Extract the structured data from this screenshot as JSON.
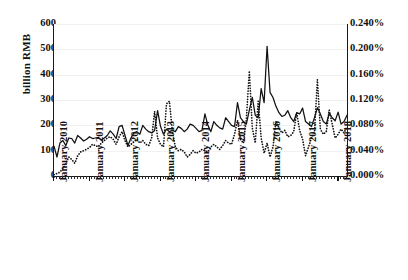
{
  "chart_data": {
    "type": "line",
    "title": "",
    "xlabel": "",
    "ylabel": "billion RMB",
    "y2label": "",
    "ylim": [
      0,
      600
    ],
    "y2lim": [
      0,
      0.24
    ],
    "grid": true,
    "legend": "none",
    "x_tick_labels": [
      "January 2010",
      "January 2011",
      "January 2012",
      "January 2013",
      "January 2014",
      "January 2015",
      "January 2016",
      "January 2017",
      "January 2018"
    ],
    "x_tick_index": [
      0,
      12,
      24,
      36,
      48,
      60,
      72,
      84,
      96
    ],
    "y_tick_labels": [
      "0",
      "100",
      "200",
      "300",
      "400",
      "500",
      "600"
    ],
    "y_tick_values": [
      0,
      100,
      200,
      300,
      400,
      500,
      600
    ],
    "y2_tick_labels": [
      "0.000%",
      "0.040%",
      "0.080%",
      "0.120%",
      "0.160%",
      "0.200%",
      "0.240%"
    ],
    "y2_tick_values": [
      0,
      0.04,
      0.08,
      0.12,
      0.16,
      0.2,
      0.24
    ],
    "n_points": 100,
    "series": [
      {
        "name": "solid-series",
        "style": "solid",
        "axis": "left",
        "units": "billion RMB",
        "values": [
          118,
          75,
          130,
          140,
          120,
          150,
          148,
          130,
          160,
          150,
          138,
          145,
          155,
          148,
          150,
          152,
          142,
          150,
          160,
          178,
          165,
          148,
          195,
          200,
          160,
          120,
          150,
          170,
          175,
          165,
          200,
          185,
          175,
          170,
          180,
          258,
          195,
          165,
          185,
          175,
          180,
          175,
          195,
          188,
          175,
          185,
          205,
          200,
          188,
          175,
          180,
          245,
          200,
          175,
          215,
          200,
          190,
          185,
          230,
          215,
          200,
          195,
          290,
          230,
          215,
          205,
          260,
          310,
          240,
          230,
          345,
          290,
          512,
          330,
          310,
          275,
          250,
          235,
          240,
          258,
          230,
          215,
          250,
          245,
          268,
          215,
          205,
          195,
          230,
          270,
          245,
          215,
          205,
          248,
          230,
          218,
          252,
          205,
          215,
          240
        ]
      },
      {
        "name": "dotted-series",
        "style": "dotted",
        "axis": "right",
        "units": "%",
        "values": [
          0.002,
          0.004,
          0.006,
          0.012,
          0.02,
          0.03,
          0.026,
          0.02,
          0.032,
          0.038,
          0.04,
          0.042,
          0.045,
          0.05,
          0.048,
          0.046,
          0.052,
          0.056,
          0.06,
          0.062,
          0.058,
          0.05,
          0.062,
          0.07,
          0.056,
          0.046,
          0.05,
          0.054,
          0.058,
          0.052,
          0.056,
          0.05,
          0.048,
          0.06,
          0.102,
          0.06,
          0.05,
          0.046,
          0.114,
          0.118,
          0.07,
          0.046,
          0.04,
          0.042,
          0.038,
          0.03,
          0.034,
          0.04,
          0.036,
          0.038,
          0.042,
          0.04,
          0.038,
          0.046,
          0.05,
          0.046,
          0.042,
          0.048,
          0.056,
          0.052,
          0.05,
          0.066,
          0.088,
          0.058,
          0.052,
          0.09,
          0.166,
          0.076,
          0.052,
          0.118,
          0.06,
          0.036,
          0.052,
          0.03,
          0.046,
          0.086,
          0.076,
          0.068,
          0.072,
          0.062,
          0.064,
          0.07,
          0.1,
          0.072,
          0.058,
          0.032,
          0.046,
          0.06,
          0.068,
          0.152,
          0.074,
          0.066,
          0.07,
          0.104,
          0.082,
          0.06,
          0.066,
          0.074,
          0.068,
          0.078
        ]
      }
    ]
  }
}
